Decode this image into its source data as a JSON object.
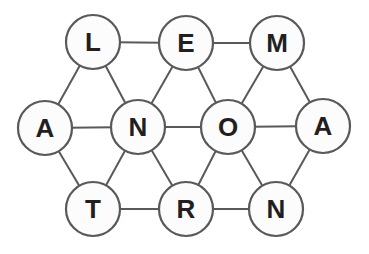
{
  "figure": {
    "name": "letter-network-puzzle",
    "canvas": {
      "width": 369,
      "height": 254,
      "background": "#ffffff"
    },
    "style": {
      "node_radius": 27,
      "node_fill": "#fcfcfc",
      "stroke_color": "#58595b",
      "stroke_width": 2.2,
      "edge_width": 2,
      "letter_color": "#231f20",
      "letter_font_size": 26
    },
    "nodes": [
      {
        "id": "L",
        "label": "L",
        "x": 93,
        "y": 42
      },
      {
        "id": "E",
        "label": "E",
        "x": 186,
        "y": 43
      },
      {
        "id": "M",
        "label": "M",
        "x": 277,
        "y": 43
      },
      {
        "id": "A1",
        "label": "A",
        "x": 45,
        "y": 128
      },
      {
        "id": "N1",
        "label": "N",
        "x": 138,
        "y": 127
      },
      {
        "id": "O",
        "label": "O",
        "x": 228,
        "y": 127
      },
      {
        "id": "A2",
        "label": "A",
        "x": 323,
        "y": 126
      },
      {
        "id": "T",
        "label": "T",
        "x": 93,
        "y": 209
      },
      {
        "id": "R",
        "label": "R",
        "x": 186,
        "y": 209
      },
      {
        "id": "N2",
        "label": "N",
        "x": 276,
        "y": 209
      }
    ],
    "edges": [
      [
        "L",
        "E"
      ],
      [
        "E",
        "M"
      ],
      [
        "A1",
        "N1"
      ],
      [
        "N1",
        "O"
      ],
      [
        "O",
        "A2"
      ],
      [
        "T",
        "R"
      ],
      [
        "R",
        "N2"
      ],
      [
        "L",
        "A1"
      ],
      [
        "L",
        "N1"
      ],
      [
        "E",
        "N1"
      ],
      [
        "E",
        "O"
      ],
      [
        "M",
        "O"
      ],
      [
        "M",
        "A2"
      ],
      [
        "A1",
        "T"
      ],
      [
        "N1",
        "T"
      ],
      [
        "N1",
        "R"
      ],
      [
        "O",
        "R"
      ],
      [
        "O",
        "N2"
      ],
      [
        "A2",
        "N2"
      ]
    ]
  }
}
